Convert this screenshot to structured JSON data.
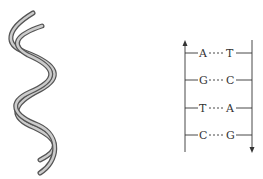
{
  "diagram": {
    "helix": {
      "label": "double-helix",
      "stroke": "#555555",
      "fill": "#bbbbbb"
    },
    "ladder": {
      "left_strand_direction": "up",
      "right_strand_direction": "down",
      "pairs": [
        {
          "left": "A",
          "right": "T"
        },
        {
          "left": "G",
          "right": "C"
        },
        {
          "left": "T",
          "right": "A"
        },
        {
          "left": "C",
          "right": "G"
        }
      ],
      "line_color": "#333333"
    }
  }
}
